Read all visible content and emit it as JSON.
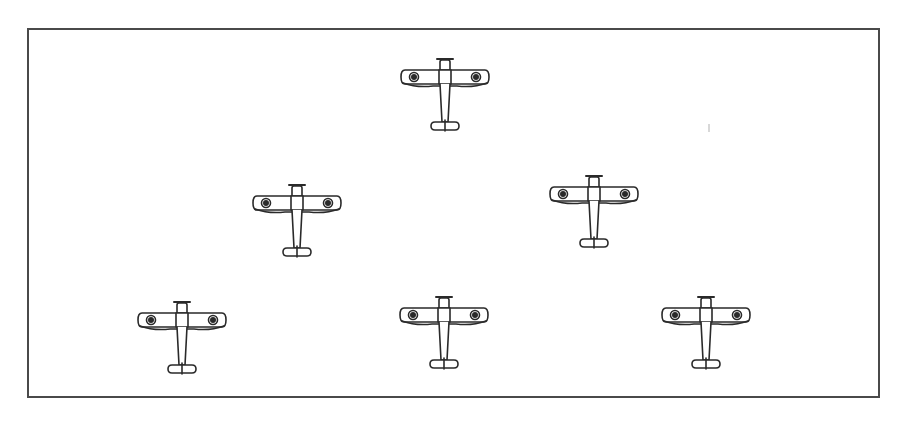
{
  "illustration": {
    "subject": "formation of six biplanes viewed from above",
    "frame": {
      "left": 27,
      "top": 28,
      "right": 878,
      "bottom": 396,
      "color": "#4a4a4a"
    },
    "ink_color": "#2a2a2a",
    "planes": [
      {
        "id": "lead",
        "cx": 445,
        "cy": 77
      },
      {
        "id": "second-row-left",
        "cx": 297,
        "cy": 203
      },
      {
        "id": "second-row-right",
        "cx": 594,
        "cy": 194
      },
      {
        "id": "third-row-left",
        "cx": 182,
        "cy": 322
      },
      {
        "id": "third-row-center",
        "cx": 444,
        "cy": 317
      },
      {
        "id": "third-row-right",
        "cx": 706,
        "cy": 317
      }
    ]
  }
}
